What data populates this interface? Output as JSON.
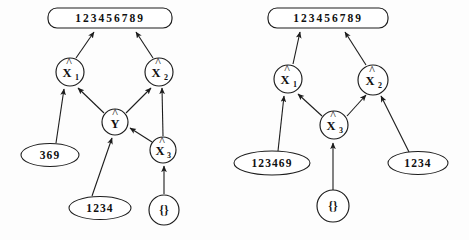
{
  "figure": {
    "background_color": "#fdfdfd",
    "line_color": "#1c1c1c",
    "text_color": "#111111"
  },
  "diagrams": [
    {
      "id": "left-diagram",
      "name": "left-inference-graph",
      "output": {
        "id": "out-left",
        "label": "123456789",
        "shape": "rounded-rect"
      },
      "nodes": [
        {
          "id": "l-x1",
          "label": "X",
          "sub": "1",
          "hat": true,
          "shape": "circle"
        },
        {
          "id": "l-x2",
          "label": "X",
          "sub": "2",
          "hat": true,
          "shape": "circle"
        },
        {
          "id": "l-y",
          "label": "Y",
          "sub": "",
          "hat": true,
          "shape": "circle"
        },
        {
          "id": "l-x3",
          "label": "X",
          "sub": "3",
          "hat": true,
          "shape": "circle"
        },
        {
          "id": "l-s369",
          "label": "369",
          "shape": "ellipse"
        },
        {
          "id": "l-s1234",
          "label": "1234",
          "shape": "ellipse"
        },
        {
          "id": "l-empty",
          "label": "{}",
          "shape": "circle"
        }
      ],
      "edges": [
        {
          "from": "l-x1",
          "to": "out-left"
        },
        {
          "from": "l-x2",
          "to": "out-left"
        },
        {
          "from": "l-s369",
          "to": "l-x1"
        },
        {
          "from": "l-y",
          "to": "l-x1"
        },
        {
          "from": "l-y",
          "to": "l-x2"
        },
        {
          "from": "l-x3",
          "to": "l-x2"
        },
        {
          "from": "l-s1234",
          "to": "l-y"
        },
        {
          "from": "l-x3",
          "to": "l-y"
        },
        {
          "from": "l-empty",
          "to": "l-x3"
        }
      ]
    },
    {
      "id": "right-diagram",
      "name": "right-inference-graph",
      "output": {
        "id": "out-right",
        "label": "123456789",
        "shape": "rounded-rect"
      },
      "nodes": [
        {
          "id": "r-x1",
          "label": "X",
          "sub": "1",
          "hat": true,
          "shape": "circle"
        },
        {
          "id": "r-x2",
          "label": "X",
          "sub": "2",
          "hat": true,
          "shape": "circle"
        },
        {
          "id": "r-x3",
          "label": "X",
          "sub": "3",
          "hat": true,
          "shape": "circle"
        },
        {
          "id": "r-s123469",
          "label": "123469",
          "shape": "ellipse"
        },
        {
          "id": "r-s1234",
          "label": "1234",
          "shape": "ellipse"
        },
        {
          "id": "r-empty",
          "label": "{}",
          "shape": "circle"
        }
      ],
      "edges": [
        {
          "from": "r-x1",
          "to": "out-right"
        },
        {
          "from": "r-x2",
          "to": "out-right"
        },
        {
          "from": "r-s123469",
          "to": "r-x1"
        },
        {
          "from": "r-x3",
          "to": "r-x1"
        },
        {
          "from": "r-x3",
          "to": "r-x2"
        },
        {
          "from": "r-s1234",
          "to": "r-x2"
        },
        {
          "from": "r-empty",
          "to": "r-x3"
        }
      ]
    }
  ],
  "labels": {
    "left": {
      "top_box": "123456789",
      "x1": "X",
      "x1_sub": "1",
      "x2": "X",
      "x2_sub": "2",
      "y": "Y",
      "x3": "X",
      "x3_sub": "3",
      "leaf_369": "369",
      "leaf_1234": "1234",
      "leaf_empty": "{}"
    },
    "right": {
      "top_box": "123456789",
      "x1": "X",
      "x1_sub": "1",
      "x2": "X",
      "x2_sub": "2",
      "x3": "X",
      "x3_sub": "3",
      "leaf_123469": "123469",
      "leaf_1234": "1234",
      "leaf_empty": "{}"
    }
  }
}
